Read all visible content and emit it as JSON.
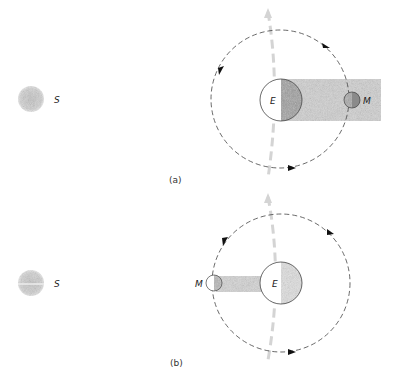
{
  "figure": {
    "panels": [
      {
        "id": "a",
        "caption": "(a)",
        "sun_label": "S",
        "earth_label": "E",
        "moon_label": "M",
        "description": "Moon on far side of Earth, within Earth's shadow (lunar eclipse)"
      },
      {
        "id": "b",
        "caption": "(b)",
        "sun_label": "S",
        "earth_label": "E",
        "moon_label": "M",
        "description": "Moon between Sun and Earth, casting shadow toward Earth (solar eclipse)"
      }
    ],
    "colors": {
      "sun": "#c8c8c8",
      "shadow": "#cfcfcf",
      "dark_half": "#9a9a9a",
      "orbit": "#444444",
      "axis": "#d4d4d4"
    }
  }
}
